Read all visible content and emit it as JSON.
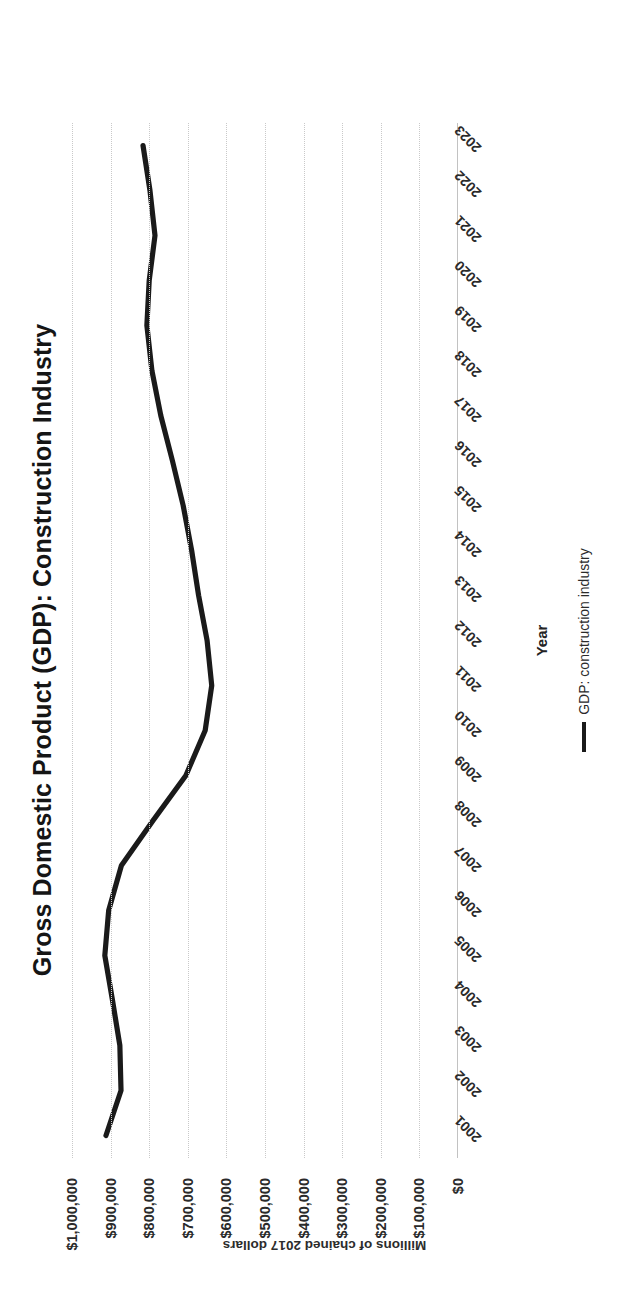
{
  "chart_data": {
    "type": "line",
    "title": "Gross Domestic Product (GDP): Construction Industry",
    "xlabel": "Year",
    "ylabel": "Millions of chained 2017 dollars",
    "grid": true,
    "legend_position": "bottom",
    "ylim": [
      0,
      1000000
    ],
    "ytick_labels": [
      "$1,000,000",
      "$900,000",
      "$800,000",
      "$700,000",
      "$600,000",
      "$500,000",
      "$400,000",
      "$300,000",
      "$200,000",
      "$100,000",
      "$0"
    ],
    "ytick_values": [
      1000000,
      900000,
      800000,
      700000,
      600000,
      500000,
      400000,
      300000,
      200000,
      100000,
      0
    ],
    "categories": [
      "2001",
      "2002",
      "2003",
      "2004",
      "2005",
      "2006",
      "2007",
      "2008",
      "2009",
      "2010",
      "2011",
      "2012",
      "2013",
      "2014",
      "2015",
      "2016",
      "2017",
      "2018",
      "2019",
      "2020",
      "2021",
      "2022",
      "2023"
    ],
    "series": [
      {
        "name": "GDP: construction industry",
        "color": "#1a1a1a",
        "values": [
          912000,
          873000,
          876000,
          895000,
          915000,
          905000,
          872000,
          790000,
          705000,
          655000,
          638000,
          650000,
          672000,
          690000,
          712000,
          740000,
          770000,
          793000,
          806000,
          800000,
          785000,
          798000,
          816000
        ]
      }
    ]
  },
  "legend": {
    "items": [
      {
        "label": "GDP: construction industry",
        "color": "#1a1a1a"
      }
    ]
  }
}
